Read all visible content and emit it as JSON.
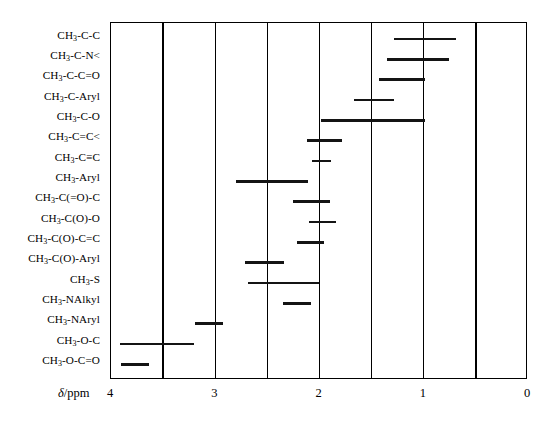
{
  "chart_data": {
    "type": "bar",
    "orientation": "horizontal-ranges",
    "title": "",
    "subtitle": "",
    "xlabel": "δ/ppm",
    "ylabel": "",
    "xlim": [
      4,
      0
    ],
    "x_axis_reversed": true,
    "xticks": [
      4,
      3,
      2,
      1,
      0
    ],
    "xtick_labels": [
      "4",
      "3",
      "2",
      "1",
      "0"
    ],
    "gridlines": [
      4.0,
      3.5,
      3.0,
      2.5,
      2.0,
      1.5,
      1.0,
      0.5,
      0.0
    ],
    "grid": true,
    "legend": "none",
    "categories": [
      "CH3-C-C",
      "CH3-C-N<",
      "CH3-C-C=O",
      "CH3-C-Aryl",
      "CH3-C-O",
      "CH3-C=C<",
      "CH3-C≡C",
      "CH3-Aryl",
      "CH3-C(=O)-C",
      "CH3-C(O)-O",
      "CH3-C(O)-C=C",
      "CH3-C(O)-Aryl",
      "CH3-S",
      "CH3-NAlkyl",
      "CH3-NAryl",
      "CH3-O-C",
      "CH3-O-C=O"
    ],
    "ranges": [
      {
        "label": "CH3-C-C",
        "start": 1.29,
        "end": 0.69
      },
      {
        "label": "CH3-C-N<",
        "start": 1.35,
        "end": 0.76
      },
      {
        "label": "CH3-C-C=O",
        "start": 1.43,
        "end": 0.99
      },
      {
        "label": "CH3-C-Aryl",
        "start": 1.67,
        "end": 1.29
      },
      {
        "label": "CH3-C-O",
        "start": 1.99,
        "end": 0.99
      },
      {
        "label": "CH3-C=C<",
        "start": 2.12,
        "end": 1.78
      },
      {
        "label": "CH3-C≡C",
        "start": 2.07,
        "end": 1.89
      },
      {
        "label": "CH3-Aryl",
        "start": 2.8,
        "end": 2.11
      },
      {
        "label": "CH3-C(=O)-C",
        "start": 2.25,
        "end": 1.9
      },
      {
        "label": "CH3-C(O)-O",
        "start": 2.1,
        "end": 1.84
      },
      {
        "label": "CH3-C(O)-C=C",
        "start": 2.22,
        "end": 1.96
      },
      {
        "label": "CH3-C(O)-Aryl",
        "start": 2.71,
        "end": 2.34
      },
      {
        "label": "CH3-S",
        "start": 2.69,
        "end": 2.0
      },
      {
        "label": "CH3-NAlkyl",
        "start": 2.35,
        "end": 2.08
      },
      {
        "label": "CH3-NAryl",
        "start": 3.19,
        "end": 2.93
      },
      {
        "label": "CH3-O-C",
        "start": 3.91,
        "end": 3.2
      },
      {
        "label": "CH3-O-C=O",
        "start": 3.9,
        "end": 3.64
      }
    ]
  },
  "axis": {
    "title_symbol": "δ",
    "title_unit": "/ppm"
  },
  "labels": [
    {
      "stem": "CH",
      "sub": "3",
      "rest": "-C-C"
    },
    {
      "stem": "CH",
      "sub": "3",
      "rest": "-C-N<"
    },
    {
      "stem": "CH",
      "sub": "3",
      "rest": "-C-C=O"
    },
    {
      "stem": "CH",
      "sub": "3",
      "rest": "-C-Aryl"
    },
    {
      "stem": "CH",
      "sub": "3",
      "rest": "-C-O"
    },
    {
      "stem": "CH",
      "sub": "3",
      "rest": "-C=C<"
    },
    {
      "stem": "CH",
      "sub": "3",
      "rest": "-C≡C"
    },
    {
      "stem": "CH",
      "sub": "3",
      "rest": "-Aryl"
    },
    {
      "stem": "CH",
      "sub": "3",
      "rest": "-C(=O)-C"
    },
    {
      "stem": "CH",
      "sub": "3",
      "rest": "-C(O)-O"
    },
    {
      "stem": "CH",
      "sub": "3",
      "rest": "-C(O)-C=C"
    },
    {
      "stem": "CH",
      "sub": "3",
      "rest": "-C(O)-Aryl"
    },
    {
      "stem": "CH",
      "sub": "3",
      "rest": "-S"
    },
    {
      "stem": "CH",
      "sub": "3",
      "rest": "-NAlkyl"
    },
    {
      "stem": "CH",
      "sub": "3",
      "rest": "-NAryl"
    },
    {
      "stem": "CH",
      "sub": "3",
      "rest": "-O-C"
    },
    {
      "stem": "CH",
      "sub": "3",
      "rest": "-O-C=O"
    }
  ],
  "colors": {
    "bar": "#141414",
    "axis": "#000000",
    "background": "#ffffff"
  }
}
